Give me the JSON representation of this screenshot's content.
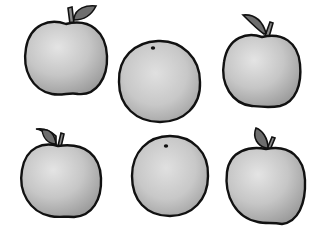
{
  "image": {
    "description": "Grayscale hand-drawn illustration of six fruits: four apples with stems and leaves and two oranges, arranged in two rows of three",
    "style": "black outline, gray watercolor shading",
    "colors": {
      "background": "#ffffff",
      "outline": "#111111",
      "body_fill": "#c4c4c4",
      "body_highlight": "#e2e2e2",
      "body_shadow": "#9e9e9e",
      "leaf_fill": "#6e6e6e",
      "stem_fill": "#8a8a8a"
    }
  },
  "fruits": [
    {
      "type": "apple",
      "row": 1,
      "col": 1,
      "label": "Apple"
    },
    {
      "type": "orange",
      "row": 1,
      "col": 2,
      "label": "Orange"
    },
    {
      "type": "apple",
      "row": 1,
      "col": 3,
      "label": "Apple"
    },
    {
      "type": "apple",
      "row": 2,
      "col": 1,
      "label": "Apple"
    },
    {
      "type": "orange",
      "row": 2,
      "col": 2,
      "label": "Orange"
    },
    {
      "type": "apple",
      "row": 2,
      "col": 3,
      "label": "Apple"
    }
  ]
}
